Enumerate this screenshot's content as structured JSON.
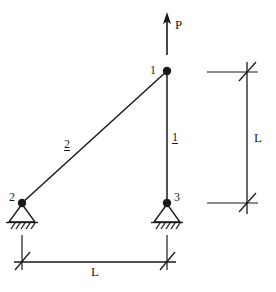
{
  "figure": {
    "type": "structural-truss-diagram",
    "stroke_color": "#1a1a1a",
    "background_color": "#ffffff"
  },
  "load": {
    "label": "P",
    "direction": "up",
    "applied_at_node": "1",
    "arrow": {
      "tip_x": 167,
      "tip_y": 13,
      "tail_x": 167,
      "tail_y": 55
    },
    "label_x": 175,
    "label_y": 18
  },
  "nodes": [
    {
      "id": "1",
      "label": "1",
      "x": 167,
      "y": 71,
      "support": "free",
      "label_x": 150,
      "label_y": 64
    },
    {
      "id": "2",
      "label": "2",
      "x": 22,
      "y": 203,
      "support": "pinned",
      "label_x": 9,
      "label_y": 196
    },
    {
      "id": "3",
      "label": "3",
      "x": 167,
      "y": 203,
      "support": "pinned",
      "label_x": 174,
      "label_y": 196
    }
  ],
  "members": [
    {
      "id": "1",
      "label": "1",
      "from_node": "1",
      "to_node": "3",
      "x1": 167,
      "y1": 71,
      "x2": 167,
      "y2": 203,
      "label_x": 172,
      "label_y": 131
    },
    {
      "id": "2",
      "label": "2",
      "from_node": "1",
      "to_node": "2",
      "x1": 167,
      "y1": 71,
      "x2": 22,
      "y2": 203,
      "label_x": 64,
      "label_y": 138
    }
  ],
  "dimensions": [
    {
      "id": "horizontal",
      "label": "L",
      "orientation": "horizontal",
      "line_y": 262,
      "from_x": 22,
      "to_x": 167,
      "label_x": 91,
      "label_y": 265
    },
    {
      "id": "vertical",
      "label": "L",
      "orientation": "vertical",
      "line_x": 247,
      "from_y": 72,
      "to_y": 203,
      "label_x": 254,
      "label_y": 131
    }
  ],
  "supports": {
    "style": "pinned-triangle-with-hatching",
    "hatch_count": 5
  }
}
